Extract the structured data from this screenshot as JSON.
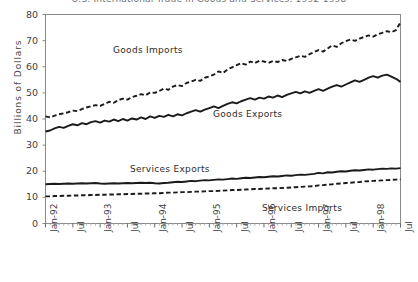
{
  "chart_data": {
    "type": "line",
    "title": "U.S. International Trade in Goods and Services, 1992-1998",
    "xlabel": "",
    "ylabel": "Billions  of  Dollars",
    "ylim": [
      0,
      80
    ],
    "ytick_values": [
      0,
      10,
      20,
      30,
      40,
      50,
      60,
      70,
      80
    ],
    "grid": false,
    "legend_position": "inline-annotations",
    "xtick_labels": [
      "Jan-92",
      "Jul",
      "Jan-93",
      "Jul",
      "Jan-94",
      "Jul",
      "Jan-95",
      "Jul",
      "Jan-96",
      "Jul",
      "Jan-97",
      "Jul",
      "Jan-98",
      "Jul"
    ],
    "xtick_indices": [
      0,
      6,
      12,
      18,
      24,
      30,
      36,
      42,
      48,
      54,
      60,
      66,
      72,
      78
    ],
    "x_months": 79,
    "series": [
      {
        "name": "Goods Imports",
        "style": "dashed",
        "color": "#1a1a1a",
        "values": [
          41.0,
          40.6,
          41.3,
          41.8,
          42.2,
          42.6,
          43.2,
          43.0,
          43.8,
          44.4,
          44.9,
          45.3,
          45.0,
          45.8,
          46.6,
          46.2,
          47.2,
          47.8,
          47.4,
          48.4,
          48.9,
          49.5,
          49.1,
          50.2,
          50.0,
          50.7,
          51.6,
          51.2,
          52.4,
          53.0,
          52.6,
          53.8,
          54.3,
          55.0,
          54.6,
          55.8,
          56.3,
          57.0,
          58.2,
          57.6,
          59.0,
          59.8,
          60.6,
          61.4,
          60.8,
          62.0,
          61.4,
          62.3,
          62.0,
          61.5,
          62.2,
          61.8,
          62.6,
          62.2,
          63.0,
          63.6,
          64.2,
          63.8,
          64.8,
          65.6,
          66.4,
          65.8,
          67.0,
          68.2,
          67.6,
          69.0,
          69.8,
          70.4,
          69.9,
          70.8,
          71.4,
          72.0,
          71.5,
          72.4,
          73.0,
          73.6,
          73.2,
          74.0,
          77.0
        ]
      },
      {
        "name": "Goods Exports",
        "style": "solid",
        "color": "#1a1a1a",
        "values": [
          35.2,
          35.6,
          36.4,
          37.0,
          36.6,
          37.4,
          38.0,
          37.6,
          38.4,
          38.0,
          38.8,
          39.2,
          38.6,
          39.4,
          39.0,
          39.8,
          39.2,
          40.0,
          39.4,
          40.2,
          39.8,
          40.6,
          40.0,
          41.0,
          40.4,
          41.2,
          40.8,
          41.6,
          41.0,
          41.8,
          41.4,
          42.2,
          42.8,
          43.4,
          42.8,
          43.6,
          44.2,
          44.8,
          44.2,
          45.0,
          45.8,
          46.4,
          46.0,
          46.8,
          47.4,
          48.0,
          47.4,
          48.2,
          47.8,
          48.6,
          48.2,
          49.0,
          48.4,
          49.2,
          49.8,
          50.4,
          49.8,
          50.6,
          50.0,
          50.8,
          51.4,
          50.8,
          51.6,
          52.4,
          53.0,
          52.4,
          53.2,
          54.0,
          54.8,
          54.2,
          55.0,
          55.8,
          56.4,
          55.8,
          56.6,
          57.0,
          56.2,
          55.4,
          54.2
        ]
      },
      {
        "name": "Services Exports",
        "style": "solid",
        "color": "#1a1a1a",
        "values": [
          15.0,
          15.1,
          15.2,
          15.1,
          15.2,
          15.3,
          15.2,
          15.3,
          15.4,
          15.3,
          15.4,
          15.5,
          15.3,
          15.2,
          15.3,
          15.4,
          15.3,
          15.4,
          15.5,
          15.4,
          15.5,
          15.6,
          15.5,
          15.6,
          15.4,
          15.3,
          15.5,
          15.6,
          15.8,
          16.0,
          15.9,
          16.1,
          16.3,
          16.2,
          16.4,
          16.6,
          16.5,
          16.7,
          16.9,
          16.8,
          17.0,
          17.2,
          17.1,
          17.3,
          17.5,
          17.4,
          17.6,
          17.8,
          17.7,
          17.9,
          18.1,
          18.0,
          18.2,
          18.4,
          18.3,
          18.5,
          18.7,
          18.6,
          18.8,
          19.0,
          19.4,
          19.2,
          19.6,
          19.5,
          19.8,
          20.0,
          19.9,
          20.2,
          20.4,
          20.3,
          20.5,
          20.7,
          20.6,
          20.8,
          21.0,
          20.9,
          21.1,
          21.0,
          21.2
        ]
      },
      {
        "name": "Services Imports",
        "style": "dashed",
        "color": "#1a1a1a",
        "values": [
          10.4,
          10.4,
          10.5,
          10.5,
          10.6,
          10.6,
          10.7,
          10.7,
          10.8,
          10.8,
          10.9,
          10.9,
          11.0,
          11.0,
          11.1,
          11.1,
          11.2,
          11.2,
          11.3,
          11.3,
          11.4,
          11.4,
          11.5,
          11.5,
          11.6,
          11.6,
          11.7,
          11.8,
          11.8,
          11.9,
          12.0,
          12.0,
          12.1,
          12.2,
          12.2,
          12.3,
          12.4,
          12.4,
          12.5,
          12.6,
          12.7,
          12.8,
          12.8,
          12.9,
          13.0,
          13.1,
          13.2,
          13.2,
          13.3,
          13.4,
          13.5,
          13.5,
          13.6,
          13.7,
          13.8,
          13.9,
          14.0,
          14.1,
          14.2,
          14.3,
          14.6,
          14.7,
          14.9,
          15.0,
          15.2,
          15.3,
          15.5,
          15.6,
          15.8,
          15.9,
          16.1,
          16.2,
          16.3,
          16.4,
          16.5,
          16.6,
          16.7,
          16.8,
          16.9
        ]
      }
    ],
    "annotations": [
      {
        "text": "Goods  Imports",
        "x_px": 113,
        "y_px": 45
      },
      {
        "text": "Goods  Exports",
        "x_px": 213,
        "y_px": 109
      },
      {
        "text": "Services  Exports",
        "x_px": 130,
        "y_px": 164
      },
      {
        "text": "Services  Imports",
        "x_px": 262,
        "y_px": 203
      }
    ]
  }
}
